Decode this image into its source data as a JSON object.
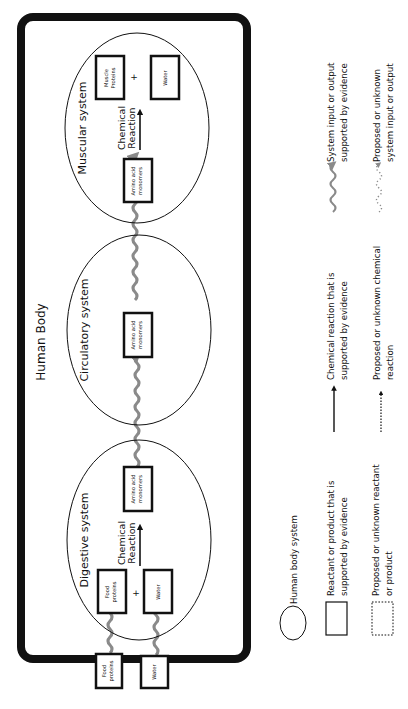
{
  "diagram": {
    "title": "Human Body",
    "orientation": "rotated-90-ccw",
    "systems": [
      {
        "name": "Muscular system",
        "reaction_label_line1": "Chemical",
        "reaction_label_line2": "Reaction",
        "reactants": [
          {
            "line1": "Amino acid",
            "line2": "monomers"
          }
        ],
        "products": [
          {
            "line1": "Muscle",
            "line2": "Proteins"
          },
          {
            "line1": "Water",
            "line2": ""
          }
        ],
        "plus": "+"
      },
      {
        "name": "Circulatory system",
        "items": [
          {
            "line1": "Amino acid",
            "line2": "monomers"
          }
        ]
      },
      {
        "name": "Digestive system",
        "reaction_label_line1": "Chemical",
        "reaction_label_line2": "Reaction",
        "reactants": [
          {
            "line1": "Food",
            "line2": "proteins"
          },
          {
            "line1": "Water",
            "line2": ""
          }
        ],
        "products": [
          {
            "line1": "Amino acid",
            "line2": "monomers"
          }
        ],
        "plus": "+"
      }
    ],
    "external_inputs": [
      {
        "line1": "Food",
        "line2": "proteins"
      },
      {
        "line1": "Water",
        "line2": ""
      }
    ]
  },
  "legend": {
    "items": [
      {
        "icon": "ellipse-icon",
        "line1": "Human body system",
        "line2": ""
      },
      {
        "icon": "solid-box-icon",
        "line1": "Reactant or product that is",
        "line2": "supported by evidence"
      },
      {
        "icon": "dashed-box-icon",
        "line1": "Proposed or unknown reactant",
        "line2": "or product"
      },
      {
        "icon": "solid-arrow-icon",
        "line1": "Chemical reaction that is",
        "line2": "supported by evidence"
      },
      {
        "icon": "dashed-arrow-icon",
        "line1": "Proposed or unknown chemical",
        "line2": "reaction"
      },
      {
        "icon": "wavy-arrow-icon",
        "line1": "System input or output",
        "line2": "supported by evidence"
      },
      {
        "icon": "dotted-wavy-arrow-icon",
        "line1": "Proposed or unknown",
        "line2": "system input or output"
      }
    ]
  },
  "colors": {
    "stroke": "#111111",
    "wavy": "#8a8a8a",
    "background": "#ffffff"
  }
}
